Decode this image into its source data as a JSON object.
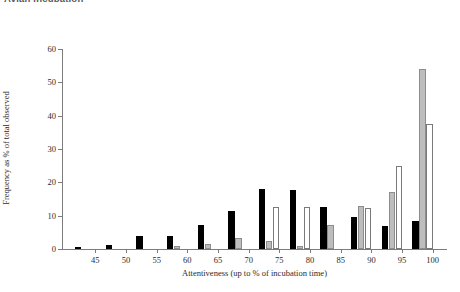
{
  "page": {
    "top_heading": "Avian incubation"
  },
  "chart_data": {
    "type": "bar",
    "title": "",
    "xlabel": "Attentiveness (up to % of incubation time)",
    "ylabel": "Frequency as % of total observed",
    "categories": [
      45,
      50,
      55,
      60,
      65,
      70,
      75,
      80,
      85,
      90,
      95,
      100
    ],
    "xtick_labels": [
      "45",
      "50",
      "55",
      "60",
      "65",
      "70",
      "75",
      "80",
      "85",
      "90",
      "95",
      "100"
    ],
    "ytick_labels": [
      "0",
      "10",
      "20",
      "30",
      "40",
      "50",
      "60"
    ],
    "yticks": [
      0,
      10,
      20,
      30,
      40,
      50,
      60
    ],
    "ylim": [
      0,
      60
    ],
    "grid": false,
    "legend": "none",
    "series": [
      {
        "name": "black",
        "color": "#000000",
        "values": [
          0.7,
          1.1,
          4.0,
          4.0,
          7.1,
          11.4,
          18.0,
          17.8,
          12.5,
          9.6,
          7.0,
          8.5
        ]
      },
      {
        "name": "grey",
        "color": "#bdbdbd",
        "values": [
          0,
          0,
          0,
          0.8,
          1.6,
          3.2,
          2.4,
          0.9,
          7.2,
          12.9,
          17.0,
          54.0
        ]
      },
      {
        "name": "white",
        "color": "#ffffff",
        "values": [
          0,
          0,
          0,
          0,
          0,
          0,
          12.5,
          12.5,
          0,
          12.4,
          25.0,
          37.5
        ]
      }
    ]
  }
}
